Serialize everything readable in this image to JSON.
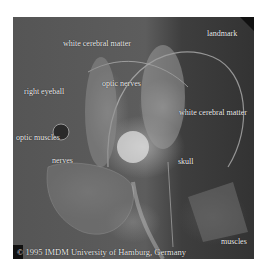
{
  "figure": {
    "labels": {
      "white_cerebral_matter_top": "white cerebral matter",
      "landmark": "landmark",
      "optic_nerves": "optic nerves",
      "right_eyeball": "right eyeball",
      "white_cerebral_matter_right": "white cerebral matter",
      "optic_muscles": "optic muscles",
      "nerves": "nerves",
      "skull": "skull",
      "muscles": "muscles"
    },
    "credit": "© 1995 IMDM University of Hamburg, Germany"
  }
}
